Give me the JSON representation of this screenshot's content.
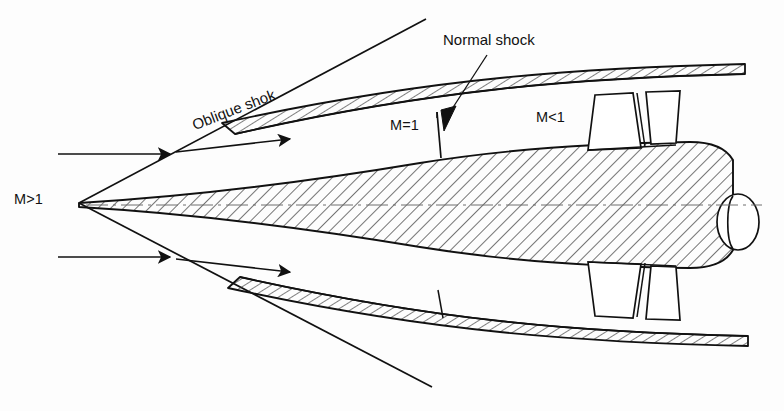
{
  "diagram": {
    "type": "technical-line-drawing",
    "width": 784,
    "height": 411,
    "background_color": "#fdfdfd",
    "line_color": "#111111",
    "hatch_color": "#3a3a3a"
  },
  "labels": {
    "freestream_mach": "M>1",
    "throat_mach": "M=1",
    "subsonic_mach": "M<1",
    "oblique_shock": "Oblique shok",
    "normal_shock": "Normal shock"
  },
  "annotations": {
    "oblique_shock_rotation_deg": -21,
    "freestream_mach_position": {
      "x": 14,
      "y": 192
    },
    "throat_mach_position": {
      "x": 390,
      "y": 118
    },
    "subsonic_mach_position": {
      "x": 536,
      "y": 110
    },
    "oblique_shock_position": {
      "x": 190,
      "y": 118
    },
    "normal_shock_position": {
      "x": 443,
      "y": 32
    }
  },
  "geometry": {
    "nose_apex": {
      "x": 79,
      "y": 203
    },
    "centerline_y": 205,
    "aft_cap_center": {
      "x": 737,
      "y": 222
    },
    "upper_cowl_leading_edge": {
      "x": 222,
      "y": 123
    },
    "lower_cowl_leading_edge": {
      "x": 228,
      "y": 288
    },
    "normal_shock_station_x": 440,
    "strut_count_per_side": 2
  },
  "flow_arrows": {
    "upper_incoming": {
      "x1": 58,
      "y1": 154,
      "x2": 172,
      "y2": 154
    },
    "upper_deflected": {
      "x1": 172,
      "y1": 152,
      "x2": 292,
      "y2": 139
    },
    "lower_incoming": {
      "x1": 58,
      "y1": 257,
      "x2": 172,
      "y2": 257
    },
    "lower_deflected": {
      "x1": 172,
      "y1": 259,
      "x2": 292,
      "y2": 272
    }
  }
}
